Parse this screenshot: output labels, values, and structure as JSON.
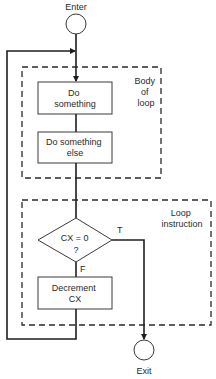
{
  "diagram": {
    "type": "flowchart",
    "terminals": {
      "enter": "Enter",
      "exit": "Exit"
    },
    "groups": {
      "body": {
        "label_lines": [
          "Body",
          "of",
          "loop"
        ]
      },
      "loop": {
        "label_lines": [
          "Loop",
          "instruction"
        ]
      }
    },
    "nodes": {
      "do_something": {
        "lines": [
          "Do",
          "something"
        ]
      },
      "do_something_else": {
        "lines": [
          "Do something",
          "else"
        ]
      },
      "decision": {
        "lines": [
          "CX = 0",
          "?"
        ]
      },
      "decrement": {
        "lines": [
          "Decrement",
          "CX"
        ]
      }
    },
    "branch_labels": {
      "true": "T",
      "false": "F"
    },
    "edges": [
      {
        "from": "Enter",
        "to": "Do something"
      },
      {
        "from": "Do something",
        "to": "Do something else"
      },
      {
        "from": "Do something else",
        "to": "CX = 0 ?"
      },
      {
        "from": "CX = 0 ?",
        "to": "Exit",
        "label": "T"
      },
      {
        "from": "CX = 0 ?",
        "to": "Decrement CX",
        "label": "F"
      },
      {
        "from": "Decrement CX",
        "to": "Do something",
        "note": "loop back"
      }
    ]
  }
}
